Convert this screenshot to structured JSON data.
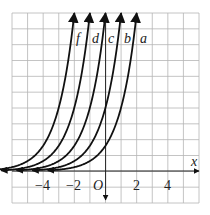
{
  "chart_data": {
    "type": "line",
    "title": "",
    "xlabel": "x",
    "ylabel": "",
    "origin_label": "O",
    "xlim": [
      -6,
      6
    ],
    "ylim": [
      -2,
      10
    ],
    "grid": true,
    "x_tick_labels": [
      "-4",
      "-2",
      "2",
      "4"
    ],
    "x_tick_values": [
      -4,
      -2,
      2,
      4
    ],
    "series": [
      {
        "name": "f",
        "x_at_top": -2,
        "asymptote_y": 0
      },
      {
        "name": "d",
        "x_at_top": -1,
        "asymptote_y": 0
      },
      {
        "name": "c",
        "x_at_top": 0,
        "asymptote_y": 0
      },
      {
        "name": "b",
        "x_at_top": 1,
        "asymptote_y": 0
      },
      {
        "name": "a",
        "x_at_top": 2,
        "asymptote_y": 0
      }
    ]
  },
  "labels": {
    "x_axis": "x",
    "origin": "O",
    "tick_m4": "−4",
    "tick_m2": "−2",
    "tick_2": "2",
    "tick_4": "4",
    "curve_f": "f",
    "curve_d": "d",
    "curve_c": "c",
    "curve_b": "b",
    "curve_a": "a"
  }
}
